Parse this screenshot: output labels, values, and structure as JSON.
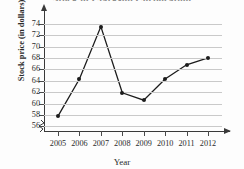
{
  "chart_data": {
    "type": "line",
    "title": "Stock of Clarkson Corporation",
    "xlabel": "Year",
    "ylabel": "Stock price (in dollars)",
    "categories": [
      "2005",
      "2006",
      "2007",
      "2008",
      "2009",
      "2010",
      "2011",
      "2012"
    ],
    "values": [
      57.8,
      64.3,
      73.5,
      61.9,
      60.6,
      64.3,
      66.8,
      68.0
    ],
    "yticks": [
      56,
      58,
      60,
      62,
      64,
      66,
      68,
      70,
      72,
      74
    ],
    "ylim": [
      55.2,
      75.0
    ],
    "xlim": [
      "2005",
      "2012"
    ],
    "grid": true,
    "legend": null,
    "axis_break_y": true,
    "marker": "filled-circle",
    "line_color": "#1c1c1c",
    "grid_color": "#c9c9c9",
    "axis_color": "#3a3a3a"
  },
  "icons": {
    "y_arrow": "arrow-up-icon",
    "x_arrow": "arrow-right-icon",
    "break": "axis-break-zigzag-icon"
  }
}
